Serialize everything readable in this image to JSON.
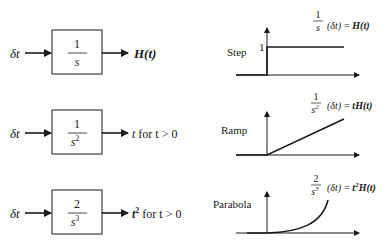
{
  "blocks": [
    {
      "input": "δt",
      "numerator": "1",
      "denominator": "s",
      "denominator_exp": "",
      "output_main": "H(t)",
      "output_exp": "",
      "output_suffix": ""
    },
    {
      "input": "δt",
      "numerator": "1",
      "denominator": "s",
      "denominator_exp": "2",
      "output_main": "t",
      "output_exp": "",
      "output_suffix": " for t > 0"
    },
    {
      "input": "δt",
      "numerator": "2",
      "denominator": "s",
      "denominator_exp": "3",
      "output_main": "t",
      "output_exp": "2",
      "output_suffix": " for t > 0"
    }
  ],
  "graphs": [
    {
      "label": "Step",
      "level_tick": "1",
      "formula": {
        "numerator": "1",
        "denominator": "s",
        "denominator_exp": "",
        "operand": "(δt) =",
        "result": "H(t)",
        "result_prefix": "",
        "result_exp": ""
      }
    },
    {
      "label": "Ramp",
      "formula": {
        "numerator": "1",
        "denominator": "s",
        "denominator_exp": "2",
        "operand": "(δt) =",
        "result": "H(t)",
        "result_prefix": "t",
        "result_exp": ""
      }
    },
    {
      "label": "Parabola",
      "formula": {
        "numerator": "2",
        "denominator": "s",
        "denominator_exp": "3",
        "operand": "(δt) =",
        "result": "H(t)",
        "result_prefix": "t",
        "result_exp": "2"
      }
    }
  ],
  "colors": {
    "ink": "#1a1a1a",
    "background": "#ffffff"
  }
}
